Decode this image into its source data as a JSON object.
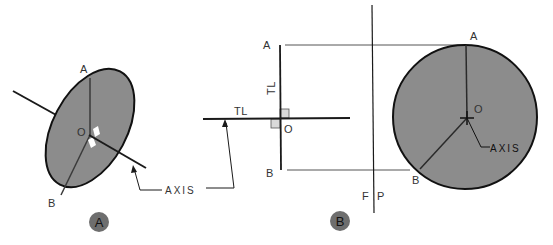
{
  "figure": {
    "view_a": {
      "point_a": "A",
      "point_b": "B",
      "center": "O",
      "axis_label": "AXIS",
      "badge": "A"
    },
    "view_b": {
      "point_a": "A",
      "point_b": "B",
      "center": "O",
      "true_length_vertical": "TL",
      "true_length_horizontal": "TL",
      "fold_line_left": "F",
      "fold_line_right": "P",
      "badge": "B"
    },
    "view_circle": {
      "point_a": "A",
      "point_b": "B",
      "center": "O",
      "axis_label": "AXIS"
    },
    "colors": {
      "disc_fill": "#8c8c8c",
      "line": "#1a1a1a",
      "badge_fill": "#6e6e6e",
      "right_angle_fill": "#d9d9d9"
    }
  }
}
